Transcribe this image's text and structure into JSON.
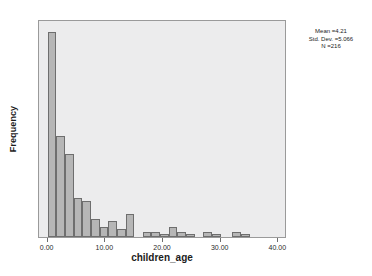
{
  "chart_data": {
    "type": "bar",
    "subtype": "histogram",
    "title": "",
    "xlabel": "children_age",
    "ylabel": "Frequency",
    "xlim": [
      -1.5,
      41.5
    ],
    "ylim": [
      0,
      84
    ],
    "grid": false,
    "legend_position": "none",
    "bin_width": 1.5,
    "x_ticks": [
      "0.00",
      "10.00",
      "20.00",
      "30.00",
      "40.00"
    ],
    "x_tick_values": [
      0,
      10,
      20,
      30,
      40
    ],
    "y_ticks": [
      "0",
      "20",
      "40",
      "60",
      "80"
    ],
    "y_tick_values": [
      0,
      20,
      40,
      60,
      80
    ],
    "bins": [
      {
        "x": 0.0,
        "value": 79
      },
      {
        "x": 1.5,
        "value": 39
      },
      {
        "x": 3.0,
        "value": 32
      },
      {
        "x": 4.5,
        "value": 15
      },
      {
        "x": 6.0,
        "value": 14
      },
      {
        "x": 7.5,
        "value": 7
      },
      {
        "x": 9.0,
        "value": 4
      },
      {
        "x": 10.5,
        "value": 6
      },
      {
        "x": 12.0,
        "value": 3
      },
      {
        "x": 13.5,
        "value": 9
      },
      {
        "x": 16.5,
        "value": 2
      },
      {
        "x": 18.0,
        "value": 2
      },
      {
        "x": 19.5,
        "value": 1
      },
      {
        "x": 21.0,
        "value": 4
      },
      {
        "x": 22.5,
        "value": 2
      },
      {
        "x": 24.0,
        "value": 1
      },
      {
        "x": 27.0,
        "value": 2
      },
      {
        "x": 28.5,
        "value": 1
      },
      {
        "x": 32.0,
        "value": 2
      },
      {
        "x": 33.5,
        "value": 1
      }
    ],
    "annotations": {
      "mean_label": "Mean =4.21",
      "std_dev_label": "Std. Dev. =5.066",
      "n_label": "N =216",
      "mean": 4.21,
      "std_dev": 5.066,
      "n": 216
    }
  },
  "colors": {
    "plot_background": "#ececed",
    "page_background": "#ffffff",
    "bar_fill": "#b6b6b6",
    "bar_stroke": "#6e6e6e",
    "axis": "#9a9a9a",
    "text": "#1c1c1c"
  }
}
